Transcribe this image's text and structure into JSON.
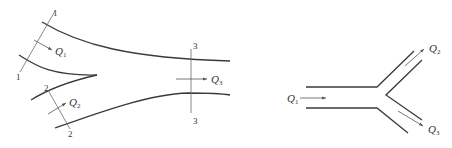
{
  "figure": {
    "left_diagram": {
      "description": "Converging confluence of two streams into one channel",
      "sections": [
        {
          "id": "1",
          "top_label": "1",
          "bottom_label": "1"
        },
        {
          "id": "2",
          "top_label": "2",
          "bottom_label": "2"
        },
        {
          "id": "3",
          "top_label": "3",
          "bottom_label": "3"
        }
      ],
      "flows": [
        {
          "symbol": "Q",
          "subscript": "1"
        },
        {
          "symbol": "Q",
          "subscript": "2"
        },
        {
          "symbol": "Q",
          "subscript": "3"
        }
      ]
    },
    "right_diagram": {
      "description": "Y-branch pipe splitting one flow into two",
      "flows": [
        {
          "symbol": "Q",
          "subscript": "1"
        },
        {
          "symbol": "Q",
          "subscript": "2"
        },
        {
          "symbol": "Q",
          "subscript": "3"
        }
      ]
    },
    "colors": {
      "wall": "#3a3a3a",
      "section_line": "#6a6a6a",
      "arrow": "#555555",
      "text": "#333333"
    }
  }
}
